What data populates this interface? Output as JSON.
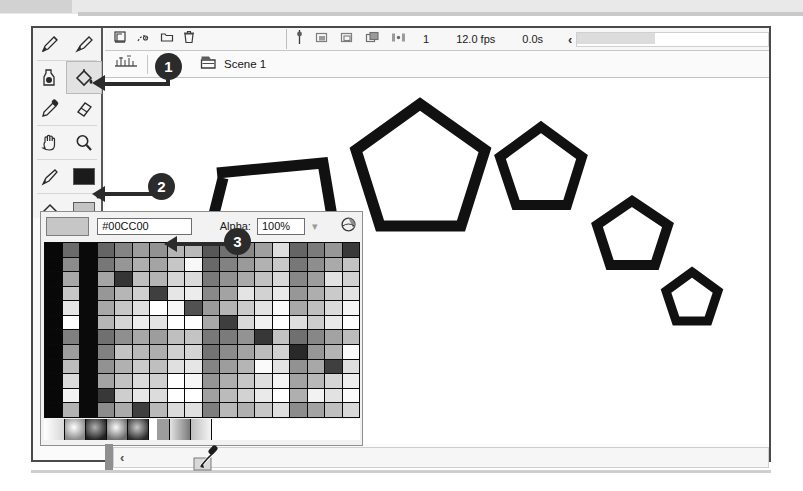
{
  "window": {
    "title": "Flash Authoring Window"
  },
  "toolbar": {
    "name": "tools-palette",
    "tools": [
      {
        "id": "pen-tool",
        "label": "Pen Tool",
        "selected": false
      },
      {
        "id": "brush-tool",
        "label": "Brush Tool",
        "selected": false
      },
      {
        "id": "ink-bottle-tool",
        "label": "Ink Bottle Tool",
        "selected": false
      },
      {
        "id": "paint-bucket-tool",
        "label": "Paint Bucket Tool",
        "selected": true
      },
      {
        "id": "eyedropper-tool",
        "label": "Eyedropper Tool",
        "selected": false
      },
      {
        "id": "eraser-tool",
        "label": "Eraser Tool",
        "selected": false
      },
      {
        "id": "hand-tool",
        "label": "Hand Tool",
        "selected": false
      },
      {
        "id": "zoom-tool",
        "label": "Zoom Tool",
        "selected": false
      },
      {
        "id": "stroke-color-tool",
        "label": "Stroke Color",
        "selected": false
      },
      {
        "id": "fill-color-tool",
        "label": "Fill Color",
        "selected": false
      }
    ],
    "stroke_color": "#1b1b1b",
    "fill_color": "#c3c3c3"
  },
  "timeline": {
    "buttons": [
      {
        "id": "new-layer-icon",
        "label": "New Layer"
      },
      {
        "id": "add-motion-guide-icon",
        "label": "Add Motion Guide"
      },
      {
        "id": "new-folder-icon",
        "label": "New Folder"
      },
      {
        "id": "delete-layer-icon",
        "label": "Delete Layer"
      }
    ],
    "playhead_icon": "playhead-icon",
    "onion_buttons": [
      {
        "id": "onion-skin-icon",
        "label": "Onion Skin"
      },
      {
        "id": "onion-skin-outlines-icon",
        "label": "Onion Skin Outlines"
      },
      {
        "id": "edit-multiple-frames-icon",
        "label": "Edit Multiple Frames"
      },
      {
        "id": "modify-onion-markers-icon",
        "label": "Modify Onion Markers"
      }
    ],
    "current_frame": "1",
    "frame_rate": "12.0 fps",
    "elapsed_time": "0.0s",
    "scroll_arrow": "‹"
  },
  "scene_bar": {
    "edit_scene_icon": "edit-scene-icon",
    "scene_icon": "scene-icon",
    "scene_label": "Scene 1"
  },
  "stage": {
    "shapes": [
      {
        "id": "open-pentagon-path",
        "label": "Open pentagon outline (unclosed path)"
      },
      {
        "id": "pentagon-large",
        "label": "Pentagon large"
      },
      {
        "id": "pentagon-medium",
        "label": "Pentagon medium"
      },
      {
        "id": "pentagon-small",
        "label": "Pentagon small"
      },
      {
        "id": "pentagon-tiny",
        "label": "Pentagon tiny"
      }
    ],
    "stroke_color": "#111111"
  },
  "color_panel": {
    "current_swatch_color": "#c6c6c6",
    "hex_value": "#00CC00",
    "alpha_label": "Alpha:",
    "alpha_value": "100%",
    "chevron_icon": "chevron-down-icon",
    "color_wheel_icon": "color-wheel-icon",
    "eyedropper_cursor_icon": "eyedropper-cursor-icon",
    "grid_rows": 12,
    "grid_cols": 18
  },
  "callouts": [
    {
      "number": "1",
      "target": "paint-bucket-tool"
    },
    {
      "number": "2",
      "target": "fill-color-tool"
    },
    {
      "number": "3",
      "target": "color-swatch-grid"
    }
  ],
  "bottom_scrollbar": {
    "arrow": "‹"
  }
}
